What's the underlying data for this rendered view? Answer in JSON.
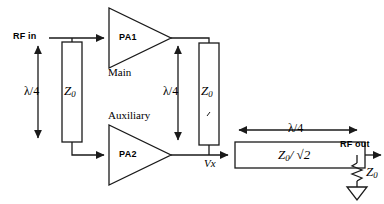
{
  "diagram": {
    "ports": {
      "input_label": "RF in",
      "output_label": "RF out",
      "node_label": "Vx"
    },
    "amplifiers": [
      {
        "id": "pa1",
        "label": "PA1",
        "branch_label": "Main"
      },
      {
        "id": "pa2",
        "label": "PA2",
        "branch_label": "Auxiliary"
      }
    ],
    "lines": [
      {
        "id": "input-stub",
        "length_label": "λ/4",
        "impedance": "Z",
        "impedance_sub": "0"
      },
      {
        "id": "offset-stub",
        "length_label": "λ/4",
        "impedance": "Z",
        "impedance_sub": "0"
      },
      {
        "id": "combiner",
        "length_label": "λ/4",
        "impedance": "Z",
        "impedance_sub": "0",
        "impedance_suffix": "/ √2"
      }
    ],
    "termination": {
      "symbol": "resistor",
      "impedance": "Z",
      "impedance_sub": "0",
      "ground": "ground-triangle"
    },
    "colors": {
      "stroke": "#1a1a1a",
      "text": "#000000",
      "background": "#ffffff"
    }
  }
}
